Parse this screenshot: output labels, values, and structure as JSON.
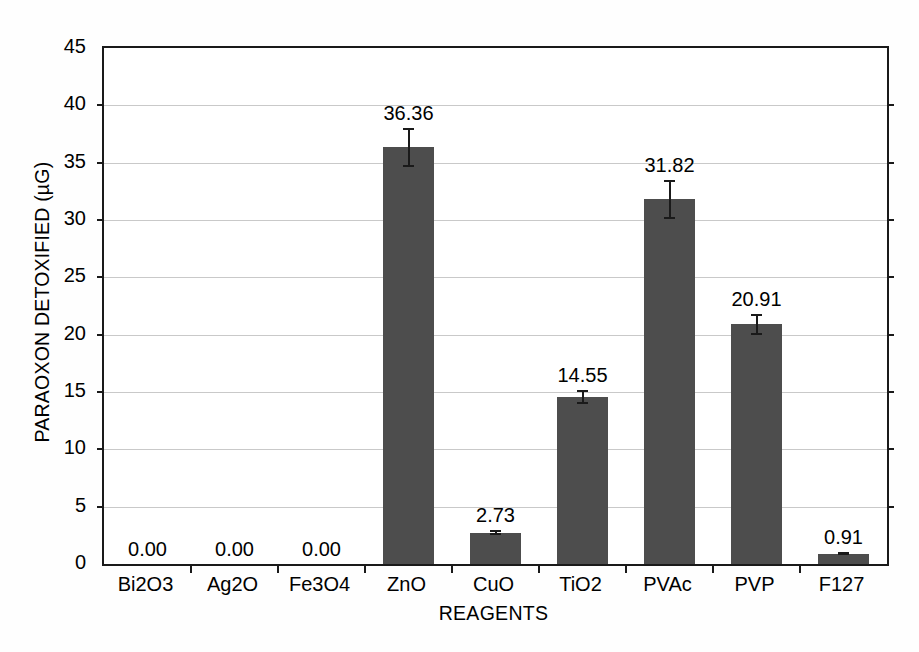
{
  "chart_data": {
    "type": "bar",
    "title": "",
    "xlabel": "REAGENTS",
    "ylabel": "PARAOXON DETOXIFIED (µG)",
    "categories": [
      "Bi2O3",
      "Ag2O",
      "Fe3O4",
      "ZnO",
      "CuO",
      "TiO2",
      "PVAc",
      "PVP",
      "F127"
    ],
    "values": [
      0.0,
      0.0,
      0.0,
      36.36,
      2.73,
      14.55,
      31.82,
      20.91,
      0.91
    ],
    "value_labels": [
      "0.00",
      "0.00",
      "0.00",
      "36.36",
      "2.73",
      "14.55",
      "31.82",
      "20.91",
      "0.91"
    ],
    "errors": [
      0.0,
      0.0,
      0.0,
      1.7,
      0.2,
      0.6,
      1.7,
      0.9,
      0.15
    ],
    "ylim": [
      0,
      45
    ],
    "yticks": [
      0,
      5,
      10,
      15,
      20,
      25,
      30,
      35,
      40,
      45
    ],
    "ytick_labels": [
      "0",
      "5",
      "10",
      "15",
      "20",
      "25",
      "30",
      "35",
      "40",
      "45"
    ],
    "grid": true,
    "grid_axis": "y",
    "legend": false,
    "bar_color": "#4d4d4d",
    "axis_color": "#1a1a1a",
    "grid_color": "#c9c9c9",
    "background_color": "#ffffff"
  }
}
